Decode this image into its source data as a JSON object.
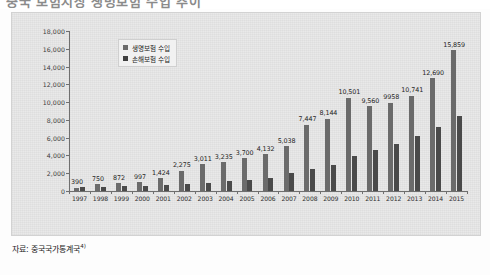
{
  "page": {
    "cropped_title": "중국 보험시장 생명보험 수입 추이",
    "source_note": "자료: 중국국가통계국",
    "source_note_ref": "4)"
  },
  "legend": {
    "position": "top-left-inside",
    "entries": [
      {
        "label": "생명보험 수입",
        "swatch": "s1",
        "color": "#6b6b6b"
      },
      {
        "label": "손해보험 수입",
        "swatch": "s2",
        "color": "#3f3f3f"
      }
    ]
  },
  "colors": {
    "series1": "#6b6b6b",
    "series2": "#4a4a4a",
    "panel_background": "#e9e9e9",
    "axis": "#6f6f6f",
    "text": "#1f1f1f"
  },
  "chart_data": {
    "type": "bar",
    "title": "중국 보험시장 생명보험 수입 추이",
    "xlabel": "",
    "ylabel": "",
    "ylim": [
      0,
      18000
    ],
    "ytick_step": 2000,
    "yticks": [
      "0",
      "2,000",
      "4,000",
      "6,000",
      "8,000",
      "10,000",
      "12,000",
      "14,000",
      "16,000",
      "18,000"
    ],
    "grid": false,
    "legend_position": "upper left",
    "categories": [
      "1997",
      "1998",
      "1999",
      "2000",
      "2001",
      "2002",
      "2003",
      "2004",
      "2005",
      "2006",
      "2007",
      "2008",
      "2009",
      "2010",
      "2011",
      "2012",
      "2013",
      "2014",
      "2015"
    ],
    "series": [
      {
        "name": "생명보험 수입",
        "color": "#6b6b6b",
        "values": [
          390,
          750,
          872,
          997,
          1424,
          2275,
          3011,
          3235,
          3700,
          4132,
          5038,
          7447,
          8144,
          10501,
          9560,
          9958,
          10741,
          12690,
          15859
        ],
        "data_labels": [
          "390",
          "750",
          "872",
          "997",
          "1,424",
          "2,275",
          "3,011",
          "3,235",
          "3,700",
          "4,132",
          "5,038",
          "7,447",
          "8,144",
          "10,501",
          "9,560",
          "9958",
          "10,741",
          "12,690",
          "15,859"
        ]
      },
      {
        "name": "손해보험 수입",
        "color": "#4a4a4a",
        "values": [
          480,
          500,
          520,
          600,
          685,
          778,
          869,
          1125,
          1283,
          1509,
          1997,
          2446,
          2876,
          3896,
          4618,
          5331,
          6212,
          7203,
          8423
        ],
        "data_labels": []
      }
    ]
  }
}
